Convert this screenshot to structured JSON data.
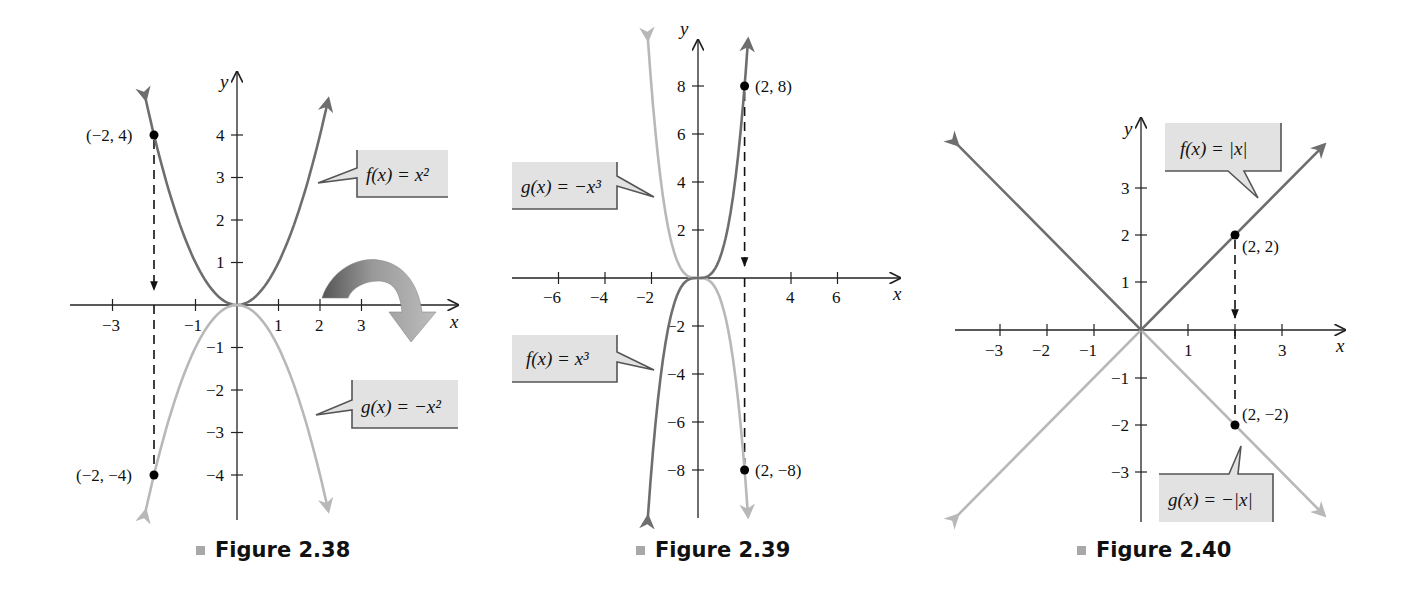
{
  "figures": [
    {
      "caption": "Figure 2.38",
      "axis_x_label": "x",
      "axis_y_label": "y",
      "x_ticks": [
        "−3",
        "−1",
        "1",
        "2",
        "3"
      ],
      "y_ticks": [
        "4",
        "3",
        "2",
        "1",
        "−1",
        "−2",
        "−3",
        "−4"
      ],
      "f_label": "f(x) = x²",
      "g_label": "g(x) = −x²",
      "points": [
        "(−2, 4)",
        "(−2, −4)"
      ]
    },
    {
      "caption": "Figure 2.39",
      "axis_x_label": "x",
      "axis_y_label": "y",
      "x_ticks": [
        "−6",
        "−4",
        "−2",
        "4",
        "6"
      ],
      "y_ticks": [
        "8",
        "6",
        "4",
        "2",
        "−2",
        "−4",
        "−6",
        "−8"
      ],
      "f_label": "f(x) = x³",
      "g_label": "g(x) = −x³",
      "points": [
        "(2, 8)",
        "(2, −8)"
      ]
    },
    {
      "caption": "Figure 2.40",
      "axis_x_label": "x",
      "axis_y_label": "y",
      "x_ticks": [
        "−3",
        "−2",
        "−1",
        "1",
        "3"
      ],
      "y_ticks": [
        "3",
        "2",
        "1",
        "−1",
        "−2",
        "−3"
      ],
      "f_label": "f(x) = |x|",
      "g_label": "g(x) = −|x|",
      "points": [
        "(2, 2)",
        "(2, −2)"
      ]
    }
  ],
  "colors": {
    "f_curve": "#6e6e6e",
    "g_curve": "#b8b8b8",
    "label_box": "#e2e2e2",
    "caption_square": "#a8a8a8"
  },
  "chart_data": [
    {
      "type": "line",
      "title": "Figure 2.38",
      "xlabel": "x",
      "ylabel": "y",
      "xlim": [
        -3.8,
        5.3
      ],
      "ylim": [
        -4.8,
        5.0
      ],
      "x_tick_values": [
        -3,
        -1,
        1,
        2,
        3
      ],
      "y_tick_values": [
        -4,
        -3,
        -2,
        -1,
        1,
        2,
        3,
        4
      ],
      "series": [
        {
          "name": "f(x) = x^2",
          "color": "#6e6e6e",
          "x": [
            -2.2,
            -2,
            -1.5,
            -1,
            -0.5,
            0,
            0.5,
            1,
            1.5,
            2,
            2.2
          ],
          "y": [
            4.84,
            4,
            2.25,
            1,
            0.25,
            0,
            0.25,
            1,
            2.25,
            4,
            4.84
          ]
        },
        {
          "name": "g(x) = -x^2",
          "color": "#b8b8b8",
          "x": [
            -2.2,
            -2,
            -1.5,
            -1,
            -0.5,
            0,
            0.5,
            1,
            1.5,
            2,
            2.2
          ],
          "y": [
            -4.84,
            -4,
            -2.25,
            -1,
            -0.25,
            0,
            -0.25,
            -1,
            -2.25,
            -4,
            -4.84
          ]
        }
      ],
      "annotations": [
        {
          "text": "(−2, 4)",
          "x": -2,
          "y": 4
        },
        {
          "text": "(−2, −4)",
          "x": -2,
          "y": -4
        },
        {
          "text": "reflection arrow (curved, about x-axis)"
        }
      ],
      "grid": false,
      "legend": "callout boxes"
    },
    {
      "type": "line",
      "title": "Figure 2.39",
      "xlabel": "x",
      "ylabel": "y",
      "xlim": [
        -8,
        8.5
      ],
      "ylim": [
        -10,
        10.5
      ],
      "x_tick_values": [
        -6,
        -4,
        -2,
        2,
        4,
        6
      ],
      "y_tick_values": [
        -8,
        -6,
        -4,
        -2,
        2,
        4,
        6,
        8
      ],
      "series": [
        {
          "name": "f(x) = x^3",
          "color": "#6e6e6e",
          "x": [
            -2.15,
            -2,
            -1.5,
            -1,
            -0.5,
            0,
            0.5,
            1,
            1.5,
            2,
            2.15
          ],
          "y": [
            -9.94,
            -8,
            -3.375,
            -1,
            -0.125,
            0,
            0.125,
            1,
            3.375,
            8,
            9.94
          ]
        },
        {
          "name": "g(x) = -x^3",
          "color": "#b8b8b8",
          "x": [
            -2.15,
            -2,
            -1.5,
            -1,
            -0.5,
            0,
            0.5,
            1,
            1.5,
            2,
            2.15
          ],
          "y": [
            9.94,
            8,
            3.375,
            1,
            0.125,
            0,
            -0.125,
            -1,
            -3.375,
            -8,
            -9.94
          ]
        }
      ],
      "annotations": [
        {
          "text": "(2, 8)",
          "x": 2,
          "y": 8
        },
        {
          "text": "(2, −8)",
          "x": 2,
          "y": -8
        }
      ],
      "grid": false,
      "legend": "callout boxes"
    },
    {
      "type": "line",
      "title": "Figure 2.40",
      "xlabel": "x",
      "ylabel": "y",
      "xlim": [
        -4,
        4.3
      ],
      "ylim": [
        -4.2,
        4.5
      ],
      "x_tick_values": [
        -3,
        -2,
        -1,
        1,
        2,
        3
      ],
      "y_tick_values": [
        -3,
        -2,
        -1,
        1,
        2,
        3
      ],
      "series": [
        {
          "name": "f(x) = |x|",
          "color": "#6e6e6e",
          "x": [
            -3.9,
            0,
            3.9
          ],
          "y": [
            3.9,
            0,
            3.9
          ]
        },
        {
          "name": "g(x) = -|x|",
          "color": "#b8b8b8",
          "x": [
            -3.9,
            0,
            3.9
          ],
          "y": [
            -3.9,
            0,
            -3.9
          ]
        }
      ],
      "annotations": [
        {
          "text": "(2, 2)",
          "x": 2,
          "y": 2
        },
        {
          "text": "(2, −2)",
          "x": 2,
          "y": -2
        }
      ],
      "grid": false,
      "legend": "callout boxes"
    }
  ]
}
